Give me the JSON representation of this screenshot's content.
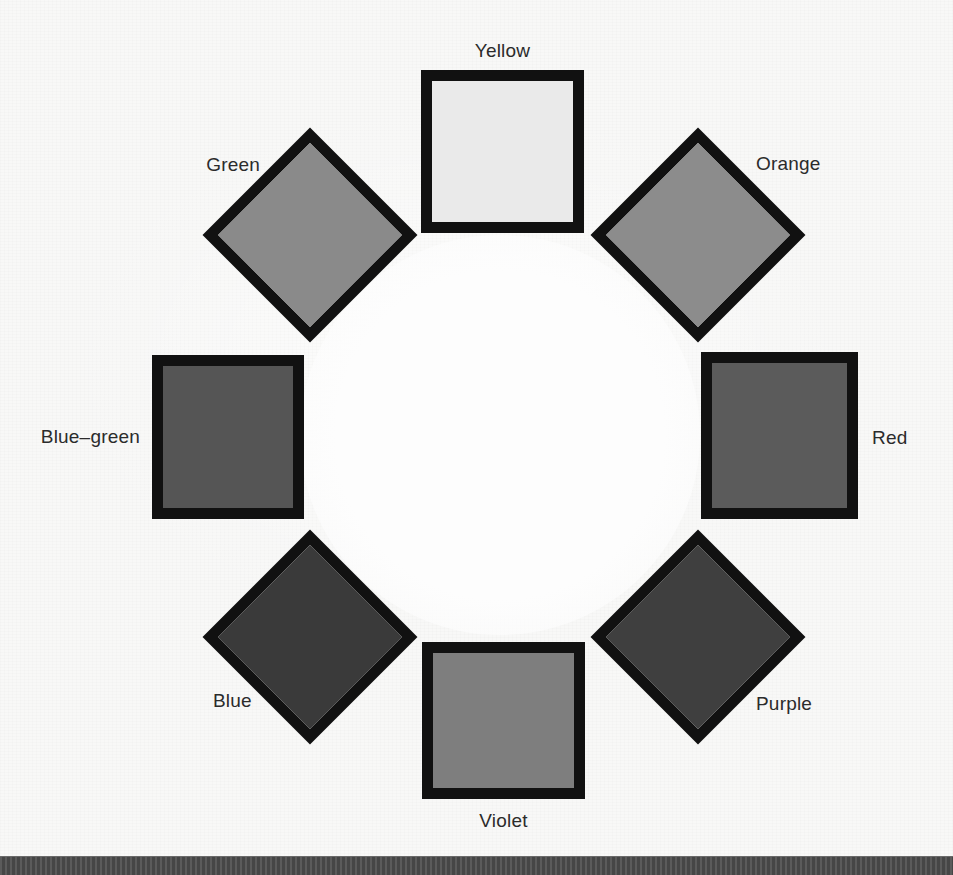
{
  "figure": {
    "type": "color-wheel-diagram",
    "background_color": "#f8f8f7",
    "border_color": "#111111",
    "label_color": "#2b2b2b",
    "bottom_bar_color": "#4b4b4b"
  },
  "swatches": [
    {
      "name": "yellow",
      "label": "Yellow",
      "shape": "square",
      "position": "top",
      "fill": "#eaeaea",
      "label_position": "above"
    },
    {
      "name": "orange",
      "label": "Orange",
      "shape": "diamond",
      "position": "top-right",
      "fill": "#8c8c8c",
      "label_position": "upper-right"
    },
    {
      "name": "red",
      "label": "Red",
      "shape": "square",
      "position": "right",
      "fill": "#5b5b5b",
      "label_position": "right"
    },
    {
      "name": "purple",
      "label": "Purple",
      "shape": "diamond",
      "position": "bottom-right",
      "fill": "#3f3f3f",
      "label_position": "lower-right"
    },
    {
      "name": "violet",
      "label": "Violet",
      "shape": "square",
      "position": "bottom",
      "fill": "#7e7e7e",
      "label_position": "below"
    },
    {
      "name": "blue",
      "label": "Blue",
      "shape": "diamond",
      "position": "bottom-left",
      "fill": "#3a3a3a",
      "label_position": "lower-left"
    },
    {
      "name": "blue-green",
      "label": "Blue–green",
      "shape": "square",
      "position": "left",
      "fill": "#555555",
      "label_position": "left"
    },
    {
      "name": "green",
      "label": "Green",
      "shape": "diamond",
      "position": "top-left",
      "fill": "#8a8a8a",
      "label_position": "upper-left"
    }
  ]
}
